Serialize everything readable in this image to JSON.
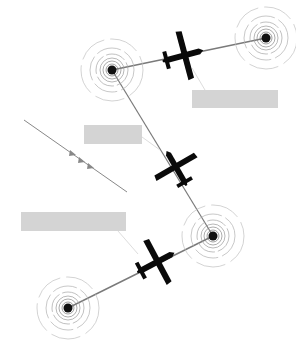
{
  "diagram": {
    "colors": {
      "beacon": "#111111",
      "ring": "#9a9a9a",
      "path": "#7a7a7a",
      "plane": "#0a0a0a",
      "label": "#d4d4d4",
      "leader": "#dddddd"
    },
    "beacons": [
      {
        "id": "beacon-top-left",
        "x": 112,
        "y": 70
      },
      {
        "id": "beacon-top-right",
        "x": 266,
        "y": 38
      },
      {
        "id": "beacon-mid-right",
        "x": 213,
        "y": 236
      },
      {
        "id": "beacon-bottom-left",
        "x": 68,
        "y": 308
      }
    ],
    "planes": [
      {
        "id": "plane-top",
        "x": 182,
        "y": 56,
        "rotation": 75
      },
      {
        "id": "plane-middle",
        "x": 177,
        "y": 169,
        "rotation": -30
      },
      {
        "id": "plane-bottom",
        "x": 155,
        "y": 263,
        "rotation": 60
      }
    ],
    "labels": [
      {
        "id": "label-top-right",
        "text": "",
        "x": 192,
        "y": 90,
        "w": 86,
        "h": 18
      },
      {
        "id": "label-middle",
        "text": "",
        "x": 84,
        "y": 125,
        "w": 58,
        "h": 19
      },
      {
        "id": "label-bottom-left",
        "text": "",
        "x": 21,
        "y": 212,
        "w": 105,
        "h": 19
      }
    ]
  }
}
